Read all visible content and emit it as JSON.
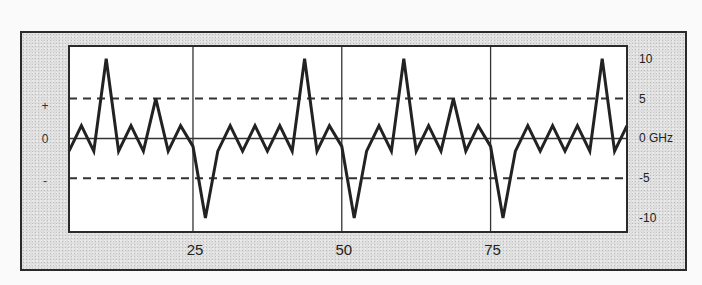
{
  "chart_data": {
    "type": "line",
    "title": "",
    "xlabel": "",
    "ylabel": "GHz",
    "xlim": [
      4.17,
      97.92
    ],
    "ylim": [
      -11.75,
      11.6
    ],
    "grid": {
      "x_solid": [
        25,
        50,
        75
      ],
      "y_solid": [
        0
      ],
      "y_dashed": [
        5,
        -5
      ]
    },
    "x_ticks": [
      {
        "value": 25,
        "label": "25"
      },
      {
        "value": 50,
        "label": "50"
      },
      {
        "value": 75,
        "label": "75"
      }
    ],
    "y_ticks_right": [
      {
        "value": 10,
        "label": "10"
      },
      {
        "value": 5,
        "label": "5"
      },
      {
        "value": 0,
        "label": "0 GHz"
      },
      {
        "value": -5,
        "label": "-5"
      },
      {
        "value": -10,
        "label": "-10"
      }
    ],
    "y_labels_left": [
      {
        "value": 4.2,
        "label": "+"
      },
      {
        "value": 0,
        "label": "0"
      },
      {
        "value": -5.2,
        "label": "-"
      }
    ],
    "legend": null,
    "series": [
      {
        "name": "signal",
        "color": "#222222",
        "x": [
          4.17,
          6.25,
          8.33,
          10.42,
          12.5,
          14.58,
          16.67,
          18.75,
          20.83,
          22.92,
          25,
          27.08,
          29.17,
          31.25,
          33.33,
          35.42,
          37.5,
          39.58,
          41.67,
          43.75,
          45.83,
          47.92,
          50,
          52.08,
          54.17,
          56.25,
          58.33,
          60.42,
          62.5,
          64.58,
          66.67,
          68.75,
          70.83,
          72.92,
          75,
          77.08,
          79.17,
          81.25,
          83.33,
          85.42,
          87.5,
          89.58,
          91.67,
          93.75,
          95.83,
          97.92
        ],
        "values": [
          -1.6,
          1.6,
          -1.6,
          10,
          -1.6,
          1.6,
          -1.6,
          5,
          -1.6,
          1.6,
          -1,
          -10,
          -1.6,
          1.6,
          -1.6,
          1.6,
          -1.6,
          1.6,
          -1.6,
          10,
          -1.6,
          1.6,
          -1,
          -10,
          -1.6,
          1.6,
          -1.6,
          10,
          -1.6,
          1.6,
          -1.6,
          5,
          -1.6,
          1.6,
          -1,
          -10,
          -1.6,
          1.6,
          -1.6,
          1.6,
          -1.6,
          1.6,
          -1.6,
          10,
          -1.6,
          1.6
        ]
      }
    ]
  },
  "layout": {
    "plot": {
      "left": 69,
      "top": 46,
      "right": 627,
      "bottom": 232
    },
    "colors": {
      "line": "#222222",
      "plot_bg": "#ffffff",
      "frame_bg": "#dedede",
      "grid": "#333333"
    }
  }
}
